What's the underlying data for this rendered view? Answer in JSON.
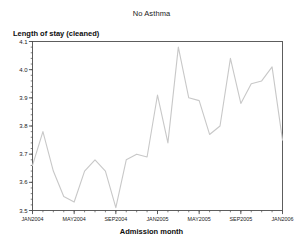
{
  "chart_data": {
    "type": "line",
    "title": "No Asthma",
    "xlabel": "Admission month",
    "ylabel": "Length of stay (cleaned)",
    "ylim": [
      3.5,
      4.1
    ],
    "ytick_labels": [
      "3.5",
      "3.6",
      "3.7",
      "3.8",
      "3.9",
      "4.0",
      "4.1"
    ],
    "ytick_values": [
      3.5,
      3.6,
      3.7,
      3.8,
      3.9,
      4.0,
      4.1
    ],
    "ytick_minor_step": 0.02,
    "xtick_labels": [
      "JAN2004",
      "MAY2004",
      "SEP2004",
      "JAN2005",
      "MAY2005",
      "SEP2005",
      "JAN2006"
    ],
    "xtick_values": [
      "2004-01",
      "2004-05",
      "2004-09",
      "2005-01",
      "2005-05",
      "2005-09",
      "2006-01"
    ],
    "xlim": [
      "2004-01",
      "2006-01"
    ],
    "grid": false,
    "legend": false,
    "line_color": "#c8c8c8",
    "axis_color": "#4d4d4d",
    "x": [
      "JAN2004",
      "FEB2004",
      "MAR2004",
      "APR2004",
      "MAY2004",
      "JUN2004",
      "JUL2004",
      "AUG2004",
      "SEP2004",
      "OCT2004",
      "NOV2004",
      "DEC2004",
      "JAN2005",
      "FEB2005",
      "MAR2005",
      "APR2005",
      "MAY2005",
      "JUN2005",
      "JUL2005",
      "AUG2005",
      "SEP2005",
      "OCT2005",
      "NOV2005",
      "DEC2005",
      "JAN2006"
    ],
    "values": [
      3.66,
      3.78,
      3.64,
      3.55,
      3.53,
      3.64,
      3.68,
      3.64,
      3.51,
      3.68,
      3.7,
      3.69,
      3.91,
      3.74,
      4.08,
      3.9,
      3.89,
      3.77,
      3.8,
      4.04,
      3.88,
      3.95,
      3.96,
      4.01,
      3.75
    ],
    "series": [
      {
        "name": "Length of stay (cleaned)",
        "values": [
          3.66,
          3.78,
          3.64,
          3.55,
          3.53,
          3.64,
          3.68,
          3.64,
          3.51,
          3.68,
          3.7,
          3.69,
          3.91,
          3.74,
          4.08,
          3.9,
          3.89,
          3.77,
          3.8,
          4.04,
          3.88,
          3.95,
          3.96,
          4.01,
          3.75
        ]
      }
    ]
  }
}
